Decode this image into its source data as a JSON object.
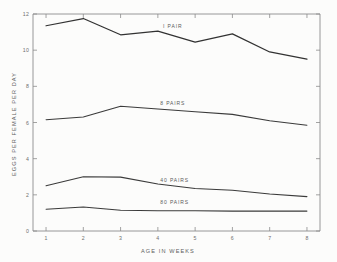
{
  "chart_data": {
    "type": "line",
    "title": "",
    "xlabel": "AGE IN WEEKS",
    "ylabel": "EGGS PER FEMALE PER DAY",
    "x": [
      1,
      2,
      3,
      4,
      5,
      6,
      7,
      8
    ],
    "xlim": [
      0.65,
      8.35
    ],
    "ylim": [
      0,
      12
    ],
    "xticks": [
      1,
      2,
      3,
      4,
      5,
      6,
      7,
      8
    ],
    "xtick_labels": [
      "1",
      "2",
      "3",
      "4",
      "5",
      "6",
      "7",
      "8"
    ],
    "yticks": [
      0,
      2,
      4,
      6,
      8,
      10,
      12
    ],
    "ytick_labels": [
      "0",
      "2",
      "4",
      "6",
      "8",
      "10",
      "12"
    ],
    "grid": false,
    "legend_position": "inline-labels",
    "series": [
      {
        "name": "1 PAIR",
        "label": "I PAIR",
        "values": [
          11.35,
          11.75,
          10.85,
          11.05,
          10.45,
          10.9,
          9.9,
          9.5
        ],
        "label_x": 4.4,
        "label_y": 11.2
      },
      {
        "name": "8 PAIRS",
        "label": "8 PAIRS",
        "values": [
          6.15,
          6.3,
          6.9,
          6.75,
          6.6,
          6.45,
          6.1,
          5.85
        ],
        "label_x": 4.4,
        "label_y": 6.95
      },
      {
        "name": "40 PAIRS",
        "label": "40 PAIRS",
        "values": [
          2.5,
          3.0,
          2.98,
          2.6,
          2.35,
          2.25,
          2.05,
          1.9
        ],
        "label_x": 4.45,
        "label_y": 2.72
      },
      {
        "name": "80 PAIRS",
        "label": "80 PAIRS",
        "values": [
          1.2,
          1.33,
          1.15,
          1.12,
          1.12,
          1.1,
          1.1,
          1.1
        ],
        "label_x": 4.45,
        "label_y": 1.52
      }
    ]
  }
}
